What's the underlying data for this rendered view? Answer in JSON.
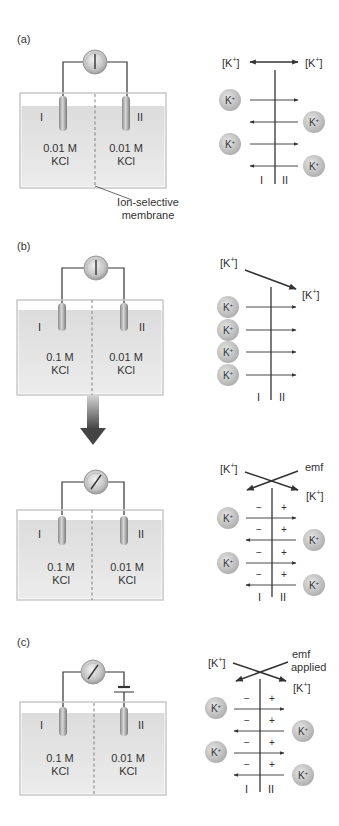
{
  "figure": {
    "panels": [
      {
        "id": "a",
        "letter": "(a)",
        "compartment_I_label": "I",
        "compartment_II_label": "II",
        "left_solution": {
          "concentration": "0.01 M",
          "salt": "KCl"
        },
        "right_solution": {
          "concentration": "0.01 M",
          "salt": "KCl"
        },
        "membrane_callout": {
          "line1": "Ion-selective",
          "line2": "membrane"
        },
        "meter_state": "zero",
        "schematic": {
          "left_conc": "[K+]",
          "right_conc": "[K+]",
          "relation": "equal (double-headed arrow)",
          "ion_label": "K+",
          "side_I": "I",
          "side_II": "II",
          "fluxes": [
            "I→II",
            "II→I",
            "I→II",
            "II→I"
          ]
        }
      },
      {
        "id": "b-initial",
        "letter": "(b)",
        "compartment_I_label": "I",
        "compartment_II_label": "II",
        "left_solution": {
          "concentration": "0.1 M",
          "salt": "KCl"
        },
        "right_solution": {
          "concentration": "0.01 M",
          "salt": "KCl"
        },
        "meter_state": "zero",
        "schematic": {
          "left_conc": "[K+]",
          "right_conc": "[K+]",
          "relation": "gradient from I to II",
          "ion_label": "K+",
          "side_I": "I",
          "side_II": "II",
          "fluxes": [
            "I→II",
            "I→II",
            "I→II",
            "I→II"
          ]
        }
      },
      {
        "id": "b-equilibrium",
        "compartment_I_label": "I",
        "compartment_II_label": "II",
        "left_solution": {
          "concentration": "0.1 M",
          "salt": "KCl"
        },
        "right_solution": {
          "concentration": "0.01 M",
          "salt": "KCl"
        },
        "meter_state": "deflected",
        "schematic": {
          "left_conc": "[K+]",
          "right_label": "emf",
          "right_conc": "[K+]",
          "relation": "crossing arrows (balance)",
          "ion_label": "K+",
          "minus": "−",
          "plus": "+",
          "side_I": "I",
          "side_II": "II",
          "fluxes": [
            "I→II",
            "II→I",
            "I→II",
            "II→I"
          ]
        }
      },
      {
        "id": "c",
        "letter": "(c)",
        "compartment_I_label": "I",
        "compartment_II_label": "II",
        "left_solution": {
          "concentration": "0.1 M",
          "salt": "KCl"
        },
        "right_solution": {
          "concentration": "0.01 M",
          "salt": "KCl"
        },
        "meter_state": "deflected",
        "battery": "applied emf source",
        "schematic": {
          "left_conc": "[K+]",
          "right_label_line1": "emf",
          "right_label_line2": "applied",
          "right_conc": "[K+]",
          "relation": "crossing arrows (balance)",
          "ion_label": "K+",
          "minus": "−",
          "plus": "+",
          "side_I": "I",
          "side_II": "II",
          "fluxes": [
            "I→II",
            "II→I",
            "I→II",
            "II→I"
          ]
        }
      }
    ],
    "colors": {
      "liquid": "#e2e2e2",
      "tank_border": "#c8c8c8",
      "wire": "#333333",
      "ion_fill": "#b5b5b5",
      "arrow": "#444444",
      "big_arrow": "#555555"
    }
  }
}
